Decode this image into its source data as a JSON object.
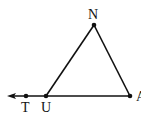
{
  "diagram": {
    "type": "geometry",
    "points": [
      {
        "id": "N",
        "label": "N",
        "x": 94,
        "y": 25
      },
      {
        "id": "U",
        "label": "U",
        "x": 46,
        "y": 96
      },
      {
        "id": "A",
        "label": "A",
        "x": 130,
        "y": 96
      },
      {
        "id": "T",
        "label": "T",
        "x": 26,
        "y": 96
      }
    ],
    "segments": [
      [
        "U",
        "N"
      ],
      [
        "N",
        "A"
      ],
      [
        "U",
        "A"
      ]
    ],
    "ray": {
      "from": "U",
      "through": "T",
      "direction": "left"
    },
    "labels": {
      "N": "N",
      "U": "U",
      "A": "A",
      "T": "T"
    }
  }
}
